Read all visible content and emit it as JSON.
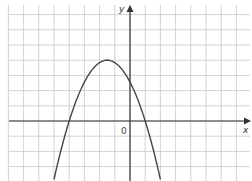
{
  "chart_data": {
    "type": "line",
    "title": "",
    "xlabel": "x",
    "ylabel": "y",
    "origin_label": "0",
    "grid": true,
    "xlim": [
      -8,
      8
    ],
    "ylim": [
      -3.7,
      7.5
    ],
    "series": [
      {
        "name": "parabola",
        "function": "y = -0.64(x + 4)(x - 1)",
        "x": [
          -5,
          -4,
          -3,
          -2,
          -1.5,
          -1,
          0,
          1,
          2
        ],
        "y": [
          -3.84,
          0,
          2.56,
          3.84,
          4,
          3.84,
          2.56,
          0,
          -3.84
        ]
      }
    ],
    "roots": [
      -4,
      1
    ],
    "vertex": [
      -1.5,
      4
    ],
    "y_intercept": 2.56
  },
  "colors": {
    "grid": "#c8c8c8",
    "axis": "#333333",
    "curve": "#444444"
  }
}
